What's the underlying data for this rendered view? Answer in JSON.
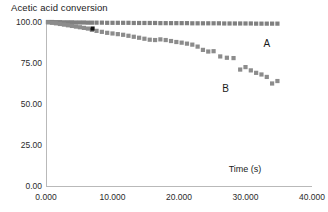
{
  "chart_data": {
    "type": "scatter",
    "title": "Acetic acid conversion",
    "xlabel": "Time (s)",
    "ylabel": "",
    "xlim": [
      0,
      40
    ],
    "ylim": [
      0,
      100
    ],
    "grid": false,
    "legend_position": "inline-annotations",
    "x_ticks": [
      "0.000",
      "10.000",
      "20.000",
      "30.000",
      "40.000"
    ],
    "x_tick_values": [
      0,
      10,
      20,
      30,
      40
    ],
    "y_ticks": [
      "0.00",
      "25.00",
      "50.00",
      "75.00",
      "100.00"
    ],
    "y_tick_values": [
      0,
      25,
      50,
      75,
      100
    ],
    "marker": "square",
    "series": [
      {
        "name": "A",
        "color": "#808080",
        "annotation": "A",
        "annotation_x": 33.2,
        "annotation_y": 84.5,
        "x": [
          0.3,
          0.9,
          1.5,
          2.1,
          2.7,
          3.3,
          3.9,
          4.5,
          5.1,
          5.7,
          6.3,
          6.9,
          7.6,
          8.4,
          9.2,
          10.0,
          10.8,
          11.6,
          12.4,
          13.2,
          14.0,
          14.8,
          15.6,
          16.4,
          17.2,
          18.0,
          18.8,
          19.6,
          20.4,
          21.2,
          22.0,
          22.8,
          23.6,
          24.4,
          25.2,
          26.0,
          26.8,
          27.6,
          28.4,
          29.2,
          30.0,
          30.8,
          31.6,
          32.4,
          33.2,
          34.0,
          34.8
        ],
        "y": [
          100.0,
          100.0,
          99.9,
          99.9,
          99.8,
          99.8,
          99.8,
          99.7,
          99.7,
          99.7,
          99.6,
          99.6,
          99.6,
          99.6,
          99.5,
          99.5,
          99.5,
          99.5,
          99.5,
          99.4,
          99.4,
          99.4,
          99.4,
          99.4,
          99.3,
          99.3,
          99.3,
          99.3,
          99.3,
          99.3,
          99.2,
          99.2,
          99.2,
          99.2,
          99.2,
          99.2,
          99.1,
          99.1,
          99.1,
          99.1,
          99.1,
          99.1,
          99.0,
          99.0,
          99.0,
          99.0,
          99.0
        ]
      },
      {
        "name": "B",
        "color": "#8c8c8c",
        "annotation": "B",
        "annotation_x": 27.0,
        "annotation_y": 57.5,
        "x": [
          0.3,
          0.9,
          1.5,
          2.1,
          2.7,
          3.3,
          3.9,
          4.5,
          5.1,
          5.7,
          6.3,
          6.9,
          7.6,
          8.4,
          9.2,
          10.0,
          10.8,
          11.6,
          12.4,
          13.2,
          14.0,
          14.8,
          15.6,
          16.4,
          17.2,
          18.0,
          18.8,
          19.6,
          20.4,
          21.2,
          22.0,
          22.8,
          23.6,
          24.4,
          25.2,
          26.2,
          27.2,
          28.2,
          29.2,
          30.0,
          30.8,
          31.6,
          32.4,
          33.2,
          34.0,
          34.8
        ],
        "y": [
          99.8,
          99.5,
          99.2,
          98.8,
          98.4,
          98.0,
          97.6,
          97.2,
          96.8,
          96.4,
          96.0,
          95.2,
          94.6,
          94.0,
          93.4,
          93.0,
          92.6,
          92.2,
          91.6,
          91.0,
          90.4,
          89.8,
          89.2,
          89.0,
          89.4,
          89.0,
          88.4,
          87.8,
          87.4,
          86.8,
          86.2,
          85.0,
          83.0,
          82.0,
          82.2,
          79.0,
          78.2,
          78.0,
          71.0,
          72.5,
          70.5,
          69.0,
          68.0,
          66.5,
          62.5,
          64.0
        ]
      },
      {
        "name": "highlight",
        "color": "#141414",
        "annotation": "",
        "x": [
          7.0
        ],
        "y": [
          96.0
        ]
      }
    ]
  }
}
